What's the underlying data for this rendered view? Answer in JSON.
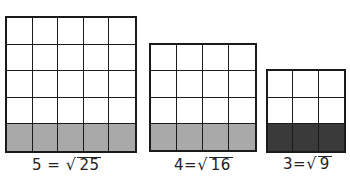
{
  "figure": {
    "colors": {
      "line": "#1a1a1a",
      "shade_light": "#a9a9a9",
      "shade_dark": "#3a3a3a",
      "background": "#ffffff"
    },
    "grids": [
      {
        "id": "grid-5",
        "size": 5,
        "cells": 25,
        "shaded_row": "bottom",
        "shade": "#a9a9a9",
        "label": {
          "root": "5",
          "equals": "=",
          "radical": "√",
          "radicand": "25"
        },
        "box": {
          "x": 5,
          "y": 16,
          "w": 132,
          "h": 137
        }
      },
      {
        "id": "grid-4",
        "size": 4,
        "cells": 16,
        "shaded_row": "bottom",
        "shade": "#a9a9a9",
        "label": {
          "root": "4",
          "equals": "=",
          "radical": "√",
          "radicand": "16"
        },
        "box": {
          "x": 149,
          "y": 43,
          "w": 108,
          "h": 109
        }
      },
      {
        "id": "grid-3",
        "size": 3,
        "cells": 9,
        "shaded_row": "bottom",
        "shade": "#3a3a3a",
        "label": {
          "root": "3",
          "equals": "=",
          "radical": "√",
          "radicand": "9"
        },
        "box": {
          "x": 266,
          "y": 69,
          "w": 80,
          "h": 84
        }
      }
    ]
  }
}
